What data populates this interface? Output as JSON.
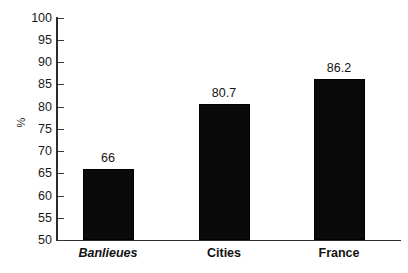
{
  "chart_data": {
    "type": "bar",
    "title": "",
    "subtitle": "",
    "xlabel": "",
    "ylabel": "%",
    "categories": [
      "Banlieues",
      "Cities",
      "France"
    ],
    "values": [
      66,
      80.7,
      86.2
    ],
    "value_labels": [
      "66",
      "80.7",
      "86.2"
    ],
    "ylim": [
      50,
      100
    ],
    "yticks": [
      50,
      55,
      60,
      65,
      70,
      75,
      80,
      85,
      90,
      95,
      100
    ],
    "ytick_labels": [
      "50",
      "55",
      "60",
      "65",
      "70",
      "75",
      "80",
      "85",
      "90",
      "95",
      "100"
    ],
    "grid": false,
    "legend": false,
    "legend_position": "none",
    "bar_color": "#0a0a0a",
    "axis_color": "#2b2b2b",
    "background_color": "#ffffff",
    "category_styles": [
      "bold-italic",
      "bold",
      "bold"
    ]
  }
}
